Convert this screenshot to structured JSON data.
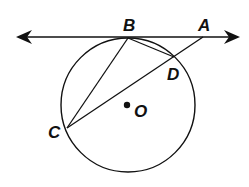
{
  "diagram": {
    "type": "circle-tangent-secant",
    "circle": {
      "center_label": "O",
      "cx": 128,
      "cy": 105,
      "r": 67
    },
    "tangent_line": {
      "x1": 16,
      "y1": 37,
      "x2": 240,
      "y2": 37,
      "arrows": "both"
    },
    "points": {
      "A": {
        "label": "A",
        "x": 203,
        "y": 37
      },
      "B": {
        "label": "B",
        "x": 128,
        "y": 38
      },
      "C": {
        "label": "C",
        "x": 67,
        "y": 128
      },
      "D": {
        "label": "D",
        "x": 174,
        "y": 57
      },
      "O": {
        "label": "O",
        "x": 127,
        "y": 105
      }
    },
    "segments": [
      "BC",
      "BD",
      "CA"
    ],
    "stroke_color": "#111111"
  }
}
